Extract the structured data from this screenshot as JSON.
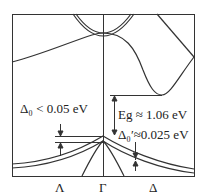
{
  "diagram": {
    "type": "band-structure",
    "annotations": {
      "spin_orbit_lambda": "Δ₀ < 0.05 eV",
      "band_gap": "Eg ≈ 1.06 eV",
      "spin_orbit_delta": "Δ₀′≈0.025 eV"
    },
    "k_points": [
      "Λ",
      "Γ",
      "Δ"
    ],
    "colors": {
      "line": "#333333",
      "background": "#ffffff"
    }
  }
}
